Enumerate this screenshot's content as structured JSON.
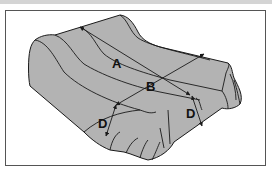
{
  "diagram": {
    "labels": {
      "a": "A",
      "b": "B",
      "d_left": "D",
      "d_right": "D"
    },
    "measurements": [
      {
        "label": "A",
        "meaning": "length along top of bed"
      },
      {
        "label": "B",
        "meaning": "width across top of bed"
      },
      {
        "label": "D",
        "meaning": "drop from top edge to floor"
      }
    ],
    "colors": {
      "fabric": "#b3b3b3",
      "outline": "#1a1a1a",
      "frame": "#555555",
      "background": "#ffffff"
    }
  }
}
